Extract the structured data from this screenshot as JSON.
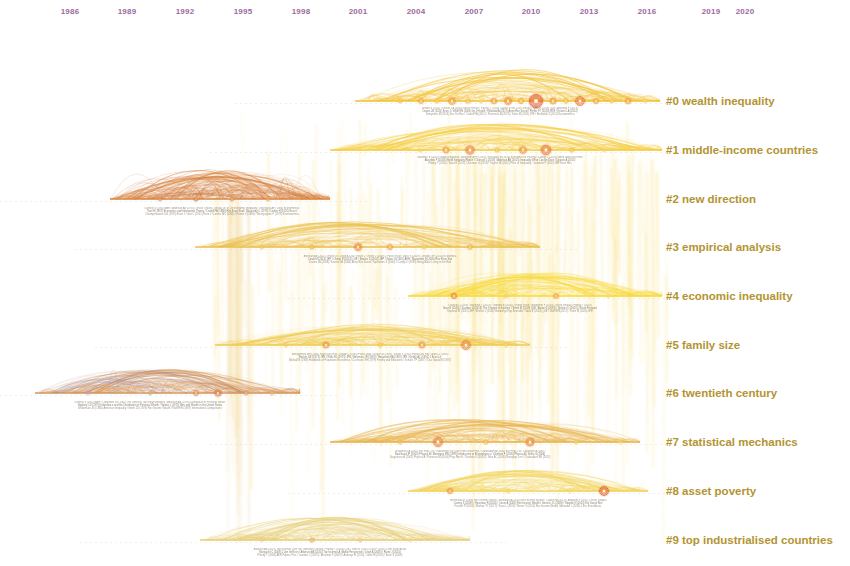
{
  "view": {
    "title": "CiteSpace Cluster Timeline View",
    "background_color": "#ffffff",
    "width": 850,
    "height": 566
  },
  "axis": {
    "name": "year-axis",
    "label_color": "#9d6a9e",
    "min_year": 1986,
    "max_year": 2020,
    "ticks": [
      {
        "year": "1986",
        "x": 70
      },
      {
        "year": "1989",
        "x": 127
      },
      {
        "year": "1992",
        "x": 185
      },
      {
        "year": "1995",
        "x": 243
      },
      {
        "year": "1998",
        "x": 301
      },
      {
        "year": "2001",
        "x": 358
      },
      {
        "year": "2004",
        "x": 416
      },
      {
        "year": "2007",
        "x": 474
      },
      {
        "year": "2010",
        "x": 531
      },
      {
        "year": "2013",
        "x": 589
      },
      {
        "year": "2016",
        "x": 647
      },
      {
        "year": "2019",
        "x": 711
      },
      {
        "year": "2020",
        "x": 745
      }
    ]
  },
  "clusters": [
    {
      "id": "#0",
      "label": "#0 wealth inequality",
      "label_y": 101,
      "band_y": 101,
      "color": "#f3c33a",
      "start_x": 355,
      "end_x": 660,
      "peak": 30
    },
    {
      "id": "#1",
      "label": "#1 middle-income countries",
      "label_y": 150,
      "band_y": 150,
      "color": "#f5cc3f",
      "start_x": 330,
      "end_x": 662,
      "peak": 26
    },
    {
      "id": "#2",
      "label": "#2 new direction",
      "label_y": 199,
      "band_y": 199,
      "color": "#dd8c4a",
      "start_x": 110,
      "end_x": 330,
      "peak": 28
    },
    {
      "id": "#3",
      "label": "#3 empirical analysis",
      "label_y": 247,
      "band_y": 247,
      "color": "#ecc152",
      "start_x": 195,
      "end_x": 540,
      "peak": 24
    },
    {
      "id": "#4",
      "label": "#4 economic inequality",
      "label_y": 296,
      "band_y": 296,
      "color": "#f7d93c",
      "start_x": 408,
      "end_x": 662,
      "peak": 24
    },
    {
      "id": "#5",
      "label": "#5 family size",
      "label_y": 345,
      "band_y": 345,
      "color": "#f0cc55",
      "start_x": 215,
      "end_x": 530,
      "peak": 20
    },
    {
      "id": "#6",
      "label": "#6 twentieth century",
      "label_y": 393,
      "band_y": 393,
      "color": "#d79a62",
      "start_x": 35,
      "end_x": 300,
      "peak": 24
    },
    {
      "id": "#7",
      "label": "#7 statistical mechanics",
      "label_y": 442,
      "band_y": 442,
      "color": "#e8b44e",
      "start_x": 330,
      "end_x": 640,
      "peak": 22
    },
    {
      "id": "#8",
      "label": "#8 asset poverty",
      "label_y": 491,
      "band_y": 491,
      "color": "#f2d45e",
      "start_x": 408,
      "end_x": 648,
      "peak": 20
    },
    {
      "id": "#9",
      "label": "#9 top industrialised countries",
      "label_y": 540,
      "band_y": 540,
      "color": "#e7cf7a",
      "start_x": 200,
      "end_x": 470,
      "peak": 22
    }
  ],
  "micro_captions": [
    {
      "cluster": "#0",
      "x": 500,
      "y": 107,
      "lines": [
        "Anand S (2011) / Keister LA (2000) Social Forces / Piketty T (2014) Capital in the 21st Century / Saez E (2016) QJE / Alvaredo F (2013)",
        "Davies JB (2011) Econ J / Wolff EN (2006) Int J Health / Killewald A (2017) Annu Rev Sociol / Pfeffer FT (2016) RSF / Keister LA (2014)",
        "Semyonov M (2013) Soc Sci Res / Cowell FA (2011) / Shorrocks A (2013) / Kuhn M (2020) JPE / Benhabib J (2011) Econometrica"
      ]
    },
    {
      "cluster": "#1",
      "x": 500,
      "y": 156,
      "lines": [
        "Milanovic B (2016) Global Inequality / Bourguignon F (2015) / Ravallion M (2016) Economics of Poverty / Lakner C (2016) World Bank Econ Rev",
        "Alvaredo F (2018) World Inequality Report / Chancel L (2019) / Atkinson AB (2015) Inequality What Can Be Done / Deaton A (2013)",
        "Piketty T (2014) / Saez E (2013) / Zucman G (2019) / Stiglitz JE (2012) Price of Inequality / Jaumotte F (2013) IMF Econ Rev"
      ]
    },
    {
      "cluster": "#2",
      "x": 222,
      "y": 207,
      "lines": [
        "Kuznets S (1955) AER / Atkinson AB (1970) J Econ Theory / Sen A (1973) On Economic Inequality / Shorrocks AF (1980) Econometrica",
        "Theil H (1967) Economics and Information Theory / Cowell FA (1980) Rev Econ Stud / Blackorby C (1978) / Dalton H (1920) Econ J",
        "Champernowne DG (1953) Econ J / Gini C (1921) Econ J / Lorenz MO (1905) / Pareto V (1896) / Bourguignon F (1979) Econometrica"
      ]
    },
    {
      "cluster": "#3",
      "x": 380,
      "y": 255,
      "lines": [
        "Atkinson AB (2011) J Econ Lit / Leigh A (2007) Econ J / Roine J (2009) J Public Econ / Bach S (2009) / Jenkins SP (2015) Economica",
        "Corak M (2013) JEP / Chetty R (2014) QJE / Bowles S (2002) JEP / Solon G (1992) AER / Mazumder B (2005) Rev Econ Stat",
        "Davies JB (2008) / Keister LA (2000) Annu Rev Sociol / Spilerman S (2000) / Conley D (1999) Being Black Living in the Red"
      ]
    },
    {
      "cluster": "#4",
      "x": 520,
      "y": 304,
      "lines": [
        "Chancel L (2019) / Blanchet T (2019) / Garbinti B (2018) J Public Econ / Novokmet F (2018) J Econ Inequal / Piketty T (2019)",
        "Saez E (2020) / Zucman G (2019) The Triumph of Injustice / Smith M (2019) QJE / Auten G (2019) / Splinter D (2020) J Econ Perspect",
        "Kopczuk W (2015) JEP / Bricker J (2016) Brookings Pap Econ Act / Saez E (2016) QJE / Wolff EN (2017) / Kuhn M (2020) JPE"
      ]
    },
    {
      "cluster": "#5",
      "x": 370,
      "y": 353,
      "lines": [
        "Montgomery MR (2000) Popul Dev Rev / Knodel J (1990) Popul Stud / Lloyd CB (1994) / Desai S (1995) Popul Dev Rev / Blake J (1989)",
        "Becker GS (1973) JPE / Willis RJ (1973) JPE / Behrman JR (1987) / Hanushek EA (1992) JPE / Kelley AC (1991) J Econ Lit",
        "Birdsall N (1988) Handbook of Population Economics / Cochrane SH (1979) Fertility and Education / Schultz TP (2007) / Das Gupta M (1987)"
      ]
    },
    {
      "cluster": "#6",
      "x": 150,
      "y": 401,
      "lines": [
        "Kuznets S (1955) AER / Lampman RJ (1962) The Share of Top Wealth-Holders / Atkinson AB (1978) Distribution of Personal Wealth",
        "Harbury CD (1979) Inheritance and the Distribution of Personal Wealth / Soltow L (1975) Men and Wealth in the United States",
        "Williamson JG (1980) American Inequality / Smith JD (1974) Rev Income Wealth / Wolff EN (1987) International Comparisons"
      ]
    },
    {
      "cluster": "#7",
      "x": 470,
      "y": 450,
      "lines": [
        "Dragulescu A (2001) Eur Phys J B / Yakovenko VM (2009) Rev Mod Phys / Chakraborti A (2000) Eur Phys J B / Chatterjee A (2007)",
        "Bouchaud JP (2000) Physica A / Mantegna RN (1999) Introduction to Econophysics / Clementi F (2005) Physica A / Sinha S (2006)",
        "Dragulescu A (2001) Physica A / Patriarca M (2004) Phys Rev E / Scafetta N (2004) / Silva AC (2005) Europhys Lett / Chakrabarti BK (2013)"
      ]
    },
    {
      "cluster": "#8",
      "x": 528,
      "y": 499,
      "lines": [
        "Sierminska E (2006) Rev Income Wealth / Brandolini A (2010) Rev Income Wealth / Cowell FA (2013) / Azpitarte F (2011) J Econ Inequal",
        "Carney S (2009) / Haveman R (2004) / Caner A (2004) Rev Income Wealth / Gornick JC (2009) / Skopek N (2014) Eur Sociol Rev",
        "Fessler P (2016) / Mathae TY (2017) / Kaas L (2019) / Bover O (2010) Rev Income Wealth / Arrondel L (2016) J Eur Econ Assoc"
      ]
    },
    {
      "cluster": "#9",
      "x": 330,
      "y": 548,
      "lines": [
        "Atkinson AB (2007) Top Incomes Over the Twentieth Century / Piketty T (2003) QJE / Saez E (2005) / Dell F (2005) J Eur Econ Assoc",
        "Moriguchi C (2008) J Jpn Int Econ / Atkinson AB (2010) Top Incomes A Global Perspective / Leigh A (2009) / Roine J (2010)",
        "Piketty T (2006) AER Papers Proc / Landais C (2007) / Alvaredo F (2009) / Aaberge R (2013) / Jantti M (2010) / Bach S (2009)"
      ]
    }
  ],
  "nodes": [
    {
      "cluster": "#0",
      "x": 400,
      "y": 101,
      "r": 1.8,
      "color": "#f2b83a"
    },
    {
      "cluster": "#0",
      "x": 421,
      "y": 101,
      "r": 2.6,
      "color": "#f0a93c"
    },
    {
      "cluster": "#0",
      "x": 437,
      "y": 101,
      "r": 2.0,
      "color": "#f4c445"
    },
    {
      "cluster": "#0",
      "x": 452,
      "y": 101,
      "r": 3.4,
      "color": "#ee9b3a"
    },
    {
      "cluster": "#0",
      "x": 468,
      "y": 101,
      "r": 2.2,
      "color": "#f3bb42"
    },
    {
      "cluster": "#0",
      "x": 481,
      "y": 101,
      "r": 1.6,
      "color": "#f5cc50"
    },
    {
      "cluster": "#0",
      "x": 494,
      "y": 101,
      "r": 2.8,
      "color": "#ef9f3a"
    },
    {
      "cluster": "#0",
      "x": 508,
      "y": 101,
      "r": 3.6,
      "color": "#ec8f38"
    },
    {
      "cluster": "#0",
      "x": 521,
      "y": 101,
      "r": 2.4,
      "color": "#f2b440"
    },
    {
      "cluster": "#0",
      "x": 536,
      "y": 101,
      "r": 6.6,
      "color": "#e0562a"
    },
    {
      "cluster": "#0",
      "x": 553,
      "y": 101,
      "r": 3.0,
      "color": "#ef9a3c"
    },
    {
      "cluster": "#0",
      "x": 566,
      "y": 101,
      "r": 2.2,
      "color": "#f3bd44"
    },
    {
      "cluster": "#0",
      "x": 580,
      "y": 101,
      "r": 4.4,
      "color": "#e7783a"
    },
    {
      "cluster": "#0",
      "x": 596,
      "y": 101,
      "r": 2.4,
      "color": "#f1ad3f"
    },
    {
      "cluster": "#0",
      "x": 612,
      "y": 101,
      "r": 1.8,
      "color": "#f5c94c"
    },
    {
      "cluster": "#0",
      "x": 628,
      "y": 101,
      "r": 2.8,
      "color": "#ef9f3d"
    },
    {
      "cluster": "#0",
      "x": 645,
      "y": 101,
      "r": 1.6,
      "color": "#f6d258"
    },
    {
      "cluster": "#1",
      "x": 420,
      "y": 150,
      "r": 1.6,
      "color": "#f5cb4a"
    },
    {
      "cluster": "#1",
      "x": 446,
      "y": 150,
      "r": 3.0,
      "color": "#ee9c3c"
    },
    {
      "cluster": "#1",
      "x": 470,
      "y": 150,
      "r": 4.2,
      "color": "#e8813a"
    },
    {
      "cluster": "#1",
      "x": 497,
      "y": 150,
      "r": 2.0,
      "color": "#f3c047"
    },
    {
      "cluster": "#1",
      "x": 523,
      "y": 150,
      "r": 3.4,
      "color": "#ec9038"
    },
    {
      "cluster": "#1",
      "x": 546,
      "y": 150,
      "r": 4.8,
      "color": "#e5763a"
    },
    {
      "cluster": "#1",
      "x": 572,
      "y": 150,
      "r": 2.0,
      "color": "#f3bd46"
    },
    {
      "cluster": "#1",
      "x": 604,
      "y": 150,
      "r": 1.6,
      "color": "#f6d055"
    },
    {
      "cluster": "#2",
      "x": 160,
      "y": 199,
      "r": 1.6,
      "color": "#d98a4e"
    },
    {
      "cluster": "#2",
      "x": 196,
      "y": 199,
      "r": 2.0,
      "color": "#d67f48"
    },
    {
      "cluster": "#2",
      "x": 232,
      "y": 199,
      "r": 1.8,
      "color": "#db9355"
    },
    {
      "cluster": "#2",
      "x": 268,
      "y": 199,
      "r": 1.6,
      "color": "#e0a262"
    },
    {
      "cluster": "#3",
      "x": 262,
      "y": 247,
      "r": 1.6,
      "color": "#f0c250"
    },
    {
      "cluster": "#3",
      "x": 312,
      "y": 247,
      "r": 2.0,
      "color": "#eeb244"
    },
    {
      "cluster": "#3",
      "x": 358,
      "y": 247,
      "r": 3.6,
      "color": "#e98a3a"
    },
    {
      "cluster": "#3",
      "x": 390,
      "y": 247,
      "r": 2.6,
      "color": "#eda23e"
    },
    {
      "cluster": "#3",
      "x": 424,
      "y": 247,
      "r": 1.8,
      "color": "#f2c64e"
    },
    {
      "cluster": "#3",
      "x": 470,
      "y": 247,
      "r": 2.2,
      "color": "#efb247"
    },
    {
      "cluster": "#4",
      "x": 454,
      "y": 296,
      "r": 2.4,
      "color": "#ea8c3c"
    },
    {
      "cluster": "#4",
      "x": 506,
      "y": 296,
      "r": 1.6,
      "color": "#f4cb4e"
    },
    {
      "cluster": "#4",
      "x": 556,
      "y": 296,
      "r": 2.2,
      "color": "#ec9a3e"
    },
    {
      "cluster": "#4",
      "x": 608,
      "y": 296,
      "r": 1.4,
      "color": "#f6d35a"
    },
    {
      "cluster": "#5",
      "x": 286,
      "y": 345,
      "r": 1.6,
      "color": "#f1c654"
    },
    {
      "cluster": "#5",
      "x": 326,
      "y": 345,
      "r": 3.0,
      "color": "#ea9640"
    },
    {
      "cluster": "#5",
      "x": 380,
      "y": 345,
      "r": 1.8,
      "color": "#f2c250"
    },
    {
      "cluster": "#5",
      "x": 422,
      "y": 345,
      "r": 3.0,
      "color": "#eb9840"
    },
    {
      "cluster": "#5",
      "x": 466,
      "y": 345,
      "r": 4.4,
      "color": "#e8843c"
    },
    {
      "cluster": "#5",
      "x": 506,
      "y": 345,
      "r": 1.6,
      "color": "#f4cd55"
    },
    {
      "cluster": "#6",
      "x": 88,
      "y": 393,
      "r": 1.4,
      "color": "#b79ab8"
    },
    {
      "cluster": "#6",
      "x": 150,
      "y": 393,
      "r": 1.6,
      "color": "#c9a37a"
    },
    {
      "cluster": "#6",
      "x": 196,
      "y": 393,
      "r": 2.6,
      "color": "#dd9254"
    },
    {
      "cluster": "#6",
      "x": 218,
      "y": 393,
      "r": 3.2,
      "color": "#d9814a"
    },
    {
      "cluster": "#6",
      "x": 246,
      "y": 393,
      "r": 2.0,
      "color": "#e0a064"
    },
    {
      "cluster": "#6",
      "x": 272,
      "y": 393,
      "r": 1.6,
      "color": "#e3ae72"
    },
    {
      "cluster": "#7",
      "x": 400,
      "y": 442,
      "r": 1.8,
      "color": "#eeb94e"
    },
    {
      "cluster": "#7",
      "x": 438,
      "y": 442,
      "r": 4.6,
      "color": "#e7803a"
    },
    {
      "cluster": "#7",
      "x": 486,
      "y": 442,
      "r": 2.0,
      "color": "#f0bb4a"
    },
    {
      "cluster": "#7",
      "x": 530,
      "y": 442,
      "r": 4.0,
      "color": "#e88b3e"
    },
    {
      "cluster": "#7",
      "x": 576,
      "y": 442,
      "r": 1.6,
      "color": "#f3cb58"
    },
    {
      "cluster": "#7",
      "x": 620,
      "y": 442,
      "r": 1.4,
      "color": "#f5d260"
    },
    {
      "cluster": "#8",
      "x": 450,
      "y": 491,
      "r": 2.6,
      "color": "#ec9540"
    },
    {
      "cluster": "#8",
      "x": 508,
      "y": 491,
      "r": 1.6,
      "color": "#f4cd55"
    },
    {
      "cluster": "#8",
      "x": 570,
      "y": 491,
      "r": 1.4,
      "color": "#f6d55e"
    },
    {
      "cluster": "#8",
      "x": 604,
      "y": 491,
      "r": 4.4,
      "color": "#df5f2c"
    },
    {
      "cluster": "#9",
      "x": 262,
      "y": 540,
      "r": 1.4,
      "color": "#e7c878"
    },
    {
      "cluster": "#9",
      "x": 312,
      "y": 540,
      "r": 2.0,
      "color": "#e0ae5c"
    },
    {
      "cluster": "#9",
      "x": 360,
      "y": 540,
      "r": 1.6,
      "color": "#e6c472"
    },
    {
      "cluster": "#9",
      "x": 410,
      "y": 540,
      "r": 1.4,
      "color": "#eacf84"
    }
  ],
  "legend_note": "Node size encodes citation count; ring color encodes citation burst strength."
}
